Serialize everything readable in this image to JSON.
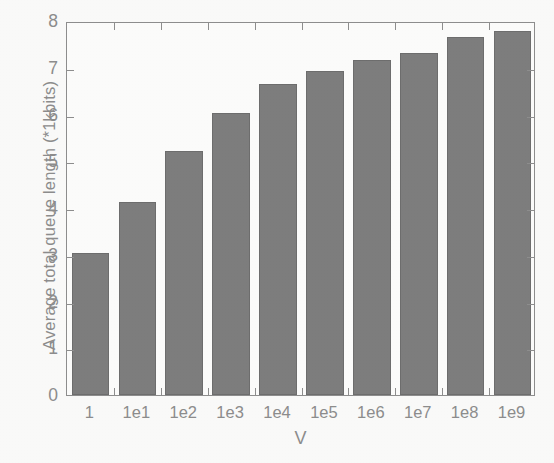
{
  "chart_data": {
    "type": "bar",
    "title": "",
    "subtitle": "",
    "xlabel": "V",
    "ylabel": "Average total queue length (*1kbits)",
    "categories": [
      "1",
      "1e1",
      "1e2",
      "1e3",
      "1e4",
      "1e5",
      "1e6",
      "1e7",
      "1e8",
      "1e9"
    ],
    "values": [
      3.03,
      4.13,
      5.22,
      6.04,
      6.65,
      6.93,
      7.16,
      7.32,
      7.65,
      7.78
    ],
    "series": [
      {
        "name": "Average total queue length",
        "values": [
          3.03,
          4.13,
          5.22,
          6.04,
          6.65,
          6.93,
          7.16,
          7.32,
          7.65,
          7.78
        ]
      }
    ],
    "ylim": [
      0,
      8
    ],
    "yticks": [
      0,
      1,
      2,
      3,
      4,
      5,
      6,
      7,
      8
    ],
    "ytick_labels": [
      "0",
      "1",
      "2",
      "3",
      "4",
      "5",
      "6",
      "7",
      "8"
    ],
    "xtick_labels": [
      "1",
      "1e1",
      "1e2",
      "1e3",
      "1e4",
      "1e5",
      "1e6",
      "1e7",
      "1e8",
      "1e9"
    ],
    "grid": false,
    "legend": null,
    "legend_position": "none",
    "annotations": [],
    "bar_color": "#7e7e7e",
    "bar_edge_color": "#6e6e6e",
    "axis_color": "#8e8e8e",
    "text_color": "#8d8d8d",
    "background_color": "#fdfdfc",
    "page_background_color": "#fbfbfa"
  }
}
